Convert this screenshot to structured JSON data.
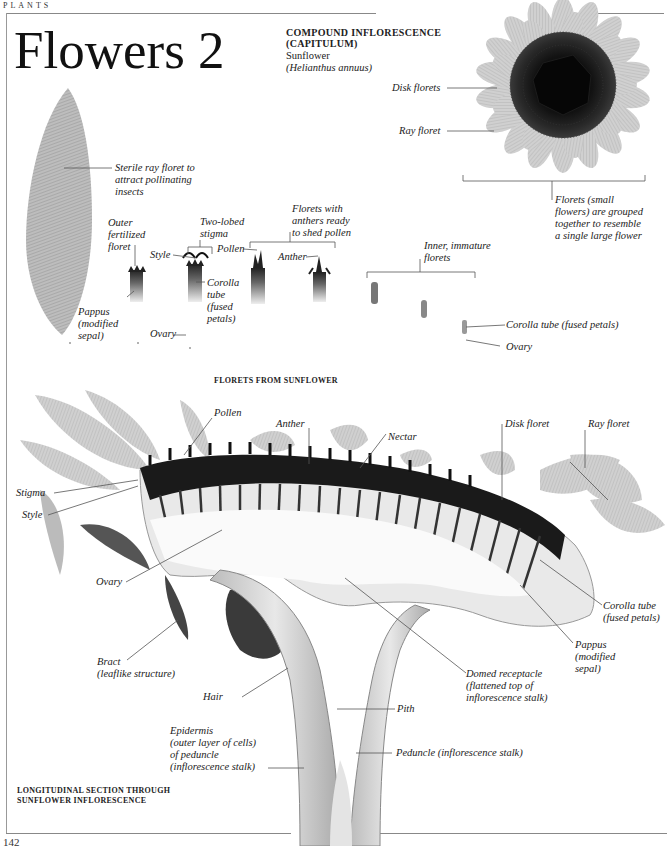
{
  "running_head": "PLANTS",
  "page_title": "Flowers 2",
  "page_number": "142",
  "capitulum": {
    "heading_line1": "COMPOUND INFLORESCENCE",
    "heading_line2": "(CAPITULUM)",
    "common_name": "Sunflower",
    "latin_name": "(Helianthus annuus)",
    "labels": {
      "disk_florets": "Disk florets",
      "ray_floret": "Ray floret",
      "florets_note": [
        "Florets (small",
        "flowers) are grouped",
        "together to resemble",
        "a single large flower"
      ]
    }
  },
  "florets_section": {
    "heading": "FLORETS FROM SUNFLOWER",
    "labels": {
      "sterile_ray": [
        "Sterile ray floret to",
        "attract pollinating",
        "insects"
      ],
      "outer_fertilized": [
        "Outer",
        "fertilized",
        "floret"
      ],
      "two_lobed_stigma": [
        "Two-lobed",
        "stigma"
      ],
      "style": "Style",
      "pollen": "Pollen",
      "anthers_ready": [
        "Florets with",
        "anthers ready",
        "to shed pollen"
      ],
      "anther": "Anther",
      "corolla_tube": [
        "Corolla",
        "tube",
        "(fused",
        "petals)"
      ],
      "pappus": [
        "Pappus",
        "(modified",
        "sepal)"
      ],
      "ovary": "Ovary",
      "inner_immature": [
        "Inner, immature",
        "florets"
      ],
      "corolla_tube_inner": "Corolla tube (fused petals)",
      "ovary_inner": "Ovary"
    }
  },
  "section": {
    "heading_line1": "LONGITUDINAL SECTION THROUGH",
    "heading_line2": "SUNFLOWER INFLORESCENCE",
    "labels": {
      "pollen": "Pollen",
      "anther": "Anther",
      "nectar": "Nectar",
      "disk_floret": "Disk floret",
      "ray_floret": "Ray floret",
      "stigma": "Stigma",
      "style": "Style",
      "ovary": "Ovary",
      "corolla_tube": [
        "Corolla tube",
        "(fused petals)"
      ],
      "pappus": [
        "Pappus",
        "(modified",
        "sepal)"
      ],
      "bract": [
        "Bract",
        "(leaflike structure)"
      ],
      "domed_receptacle": [
        "Domed receptacle",
        "(flattened top of",
        "inflorescence stalk)"
      ],
      "hair": "Hair",
      "pith": "Pith",
      "epidermis": [
        "Epidermis",
        "(outer layer of cells)",
        "of peduncle",
        "(inflorescence stalk)"
      ],
      "peduncle": "Peduncle (inflorescence stalk)"
    }
  }
}
